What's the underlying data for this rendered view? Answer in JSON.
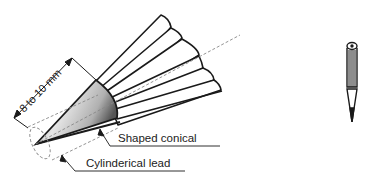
{
  "diagram": {
    "dimension_label": "8 to 10 mm",
    "callouts": [
      {
        "id": "shaped-conical",
        "text": "Shaped conical"
      },
      {
        "id": "cylindrical-lead",
        "text": "Cylinderical lead"
      }
    ],
    "side_icon": "pencil-icon",
    "colors": {
      "stroke": "#1a1a1a",
      "dashed": "#888888",
      "cone_light": "#f2f2f2",
      "cone_dark": "#707070"
    }
  }
}
